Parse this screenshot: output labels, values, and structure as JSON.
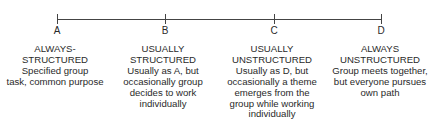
{
  "scale": {
    "points": [
      {
        "label": "A",
        "x": 57
      },
      {
        "label": "B",
        "x": 165
      },
      {
        "label": "C",
        "x": 274
      },
      {
        "label": "D",
        "x": 381
      }
    ]
  },
  "columns": [
    {
      "point": "A",
      "title_lines": [
        "ALWAYS-",
        "STRUCTURED"
      ],
      "desc_lines": [
        "Specified group",
        "task, common purpose"
      ]
    },
    {
      "point": "B",
      "title_lines": [
        "USUALLY",
        "STRUCTURED"
      ],
      "desc_lines": [
        "Usually as A, but",
        "occasionally group",
        "decides to work",
        "individually"
      ]
    },
    {
      "point": "C",
      "title_lines": [
        "USUALLY",
        "UNSTRUCTURED"
      ],
      "desc_lines": [
        "Usually as D, but",
        "occasionally a theme",
        "emerges from the",
        "group while working",
        "individually"
      ]
    },
    {
      "point": "D",
      "title_lines": [
        "ALWAYS",
        "UNSTRUCTURED"
      ],
      "desc_lines": [
        "Group meets together,",
        "but everyone pursues",
        "own path"
      ]
    }
  ],
  "colors": {
    "line": "#444444",
    "text": "#2a2a2a",
    "background": "#ffffff"
  }
}
